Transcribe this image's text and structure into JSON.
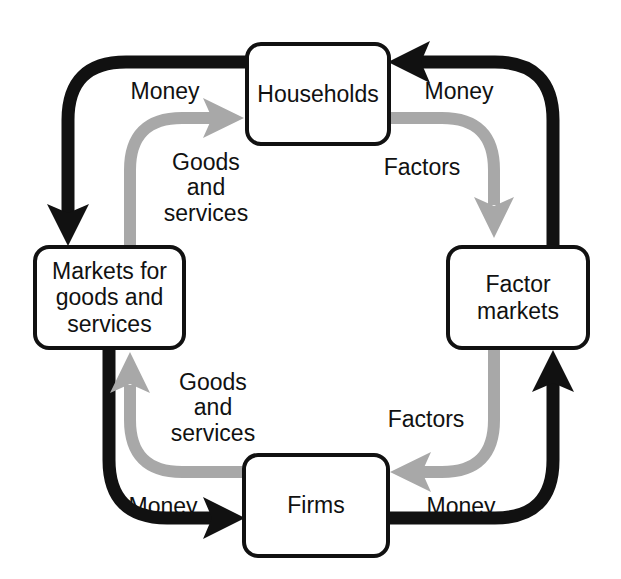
{
  "diagram": {
    "type": "circular-flow",
    "colors": {
      "money_flow": "#111111",
      "goods_factors_flow": "#A8A8A8",
      "box_border": "#111111",
      "box_fill": "#FFFFFF",
      "text": "#111111",
      "background": "#FFFFFF"
    },
    "nodes": [
      {
        "id": "households",
        "label": "Households",
        "position": "top"
      },
      {
        "id": "markets-goods-services",
        "label": "Markets for\ngoods and\nservices",
        "position": "left"
      },
      {
        "id": "factor-markets",
        "label": "Factor\nmarkets",
        "position": "right"
      },
      {
        "id": "firms",
        "label": "Firms",
        "position": "bottom"
      }
    ],
    "labels": [
      {
        "id": "money-top-left",
        "text": "Money",
        "flow": "money",
        "corner": "top-left"
      },
      {
        "id": "money-top-right",
        "text": "Money",
        "flow": "money",
        "corner": "top-right"
      },
      {
        "id": "money-bottom-left",
        "text": "Money",
        "flow": "money",
        "corner": "bottom-left"
      },
      {
        "id": "money-bottom-right",
        "text": "Money",
        "flow": "money",
        "corner": "bottom-right"
      },
      {
        "id": "goods-top-left",
        "text": "Goods\nand\nservices",
        "flow": "goods",
        "corner": "top-left"
      },
      {
        "id": "goods-bottom-left",
        "text": "Goods\nand\nservices",
        "flow": "goods",
        "corner": "bottom-left"
      },
      {
        "id": "factors-top-right",
        "text": "Factors",
        "flow": "factors",
        "corner": "top-right"
      },
      {
        "id": "factors-bottom-right",
        "text": "Factors",
        "flow": "factors",
        "corner": "bottom-right"
      }
    ],
    "flows": [
      {
        "id": "money-households-to-goods-markets",
        "from": "households",
        "to": "markets-goods-services",
        "label": "Money",
        "color": "money"
      },
      {
        "id": "goods-markets-to-households",
        "from": "markets-goods-services",
        "to": "households",
        "label": "Goods and services",
        "color": "goods"
      },
      {
        "id": "money-factor-markets-to-households",
        "from": "factor-markets",
        "to": "households",
        "label": "Money",
        "color": "money"
      },
      {
        "id": "factors-households-to-factor-markets",
        "from": "households",
        "to": "factor-markets",
        "label": "Factors",
        "color": "goods"
      },
      {
        "id": "money-firms-to-factor-markets",
        "from": "firms",
        "to": "factor-markets",
        "label": "Money",
        "color": "money"
      },
      {
        "id": "factors-factor-markets-to-firms",
        "from": "factor-markets",
        "to": "firms",
        "label": "Factors",
        "color": "goods"
      },
      {
        "id": "money-goods-markets-to-firms",
        "from": "markets-goods-services",
        "to": "firms",
        "label": "Money",
        "color": "money"
      },
      {
        "id": "goods-firms-to-goods-markets",
        "from": "firms",
        "to": "markets-goods-services",
        "label": "Goods and services",
        "color": "goods"
      }
    ]
  }
}
